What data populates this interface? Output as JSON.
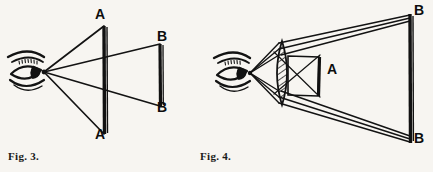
{
  "page": {
    "background_color": "#f7f5f1",
    "ink_color": "#111111",
    "width": 433,
    "height": 172
  },
  "figures": [
    {
      "id": "fig3",
      "caption": "Fig. 3.",
      "description": "Unaided eye viewing two objects: near object A-A subtends a large visual angle, far object B-B subtends a smaller visual angle",
      "eye": {
        "name": "eye-icon",
        "cx": 30,
        "cy": 72
      },
      "labels": [
        {
          "text": "A",
          "x": 96,
          "y": 8
        },
        {
          "text": "A",
          "x": 96,
          "y": 127
        },
        {
          "text": "B",
          "x": 158,
          "y": 30
        },
        {
          "text": "B",
          "x": 158,
          "y": 101
        }
      ],
      "objects": [
        {
          "name": "object-a-near",
          "x": 104,
          "y1": 26,
          "y2": 134
        },
        {
          "name": "object-b-far",
          "x": 160,
          "y1": 44,
          "y2": 106
        }
      ]
    },
    {
      "id": "fig4",
      "caption": "Fig. 4.",
      "description": "Eye viewing a small object A through a biconvex magnifying lens; refracted rays trace back to the enlarged virtual image B-B",
      "eye": {
        "name": "eye-icon",
        "cx": 237,
        "cy": 73
      },
      "lens": {
        "name": "convex-lens",
        "cx": 282,
        "cy": 73,
        "half_height": 32,
        "bulge": 9,
        "hatched": true
      },
      "labels": [
        {
          "text": "A",
          "x": 327,
          "y": 62
        },
        {
          "text": "B",
          "x": 415,
          "y": 4
        },
        {
          "text": "B",
          "x": 415,
          "y": 132
        }
      ],
      "objects": [
        {
          "name": "object-a-small",
          "x1": 288,
          "x2": 318,
          "y1": 56,
          "y2": 96
        },
        {
          "name": "virtual-image-b",
          "x": 410,
          "y1": 14,
          "y2": 143
        }
      ]
    }
  ]
}
